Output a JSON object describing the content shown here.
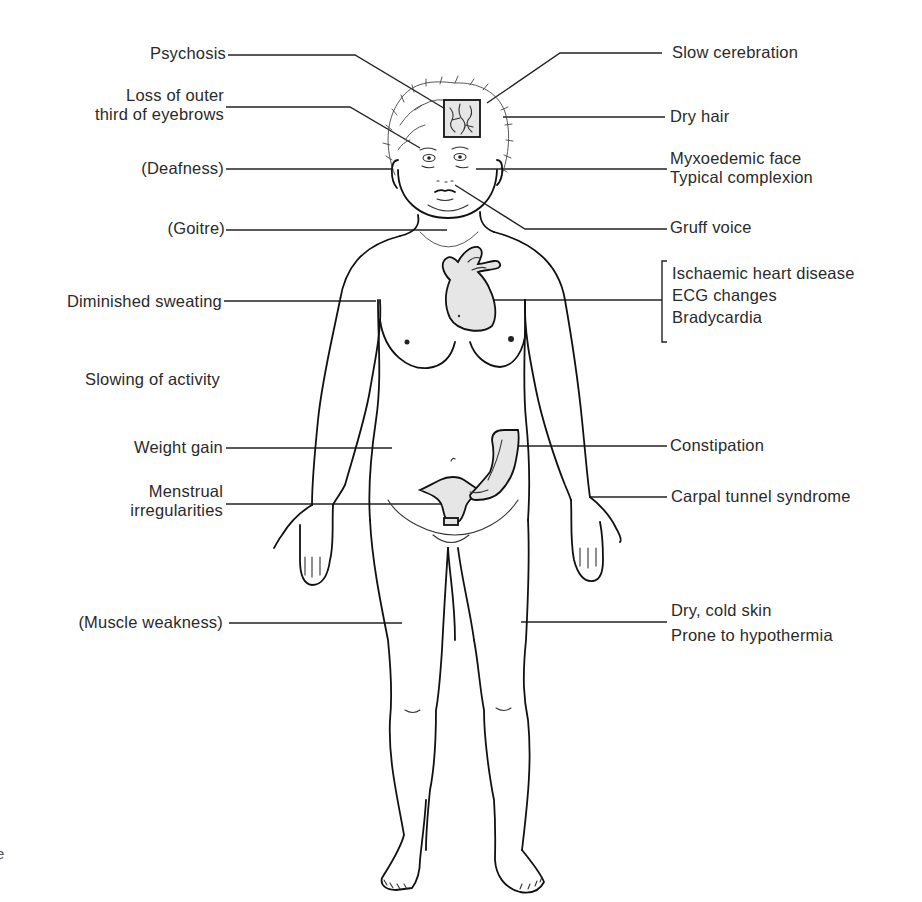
{
  "figure": {
    "organ_fill_color": "#e6e6e6",
    "line_color": "#222222",
    "background": "#ffffff"
  },
  "labels_left": [
    {
      "id": "psychosis",
      "lines": [
        "Psychosis"
      ]
    },
    {
      "id": "eyebrows",
      "lines": [
        "Loss of outer",
        "third of eyebrows"
      ]
    },
    {
      "id": "deafness",
      "lines": [
        "(Deafness)"
      ]
    },
    {
      "id": "goitre",
      "lines": [
        "(Goitre)"
      ]
    },
    {
      "id": "sweating",
      "lines": [
        "Diminished sweating"
      ]
    },
    {
      "id": "activity",
      "lines": [
        "Slowing of activity"
      ]
    },
    {
      "id": "weight",
      "lines": [
        "Weight gain"
      ]
    },
    {
      "id": "menstrual",
      "lines": [
        "Menstrual",
        "irregularities"
      ]
    },
    {
      "id": "muscle",
      "lines": [
        "(Muscle weakness)"
      ]
    }
  ],
  "labels_right": [
    {
      "id": "cerebration",
      "lines": [
        "Slow cerebration"
      ]
    },
    {
      "id": "hair",
      "lines": [
        "Dry hair"
      ]
    },
    {
      "id": "face",
      "lines": [
        "Myxoedemic face",
        "Typical complexion"
      ]
    },
    {
      "id": "voice",
      "lines": [
        "Gruff voice"
      ]
    },
    {
      "id": "heart",
      "lines": [
        "Ischaemic heart disease",
        "ECG changes",
        "Bradycardia"
      ]
    },
    {
      "id": "constipation",
      "lines": [
        "Constipation"
      ]
    },
    {
      "id": "carpal",
      "lines": [
        "Carpal tunnel syndrome"
      ]
    },
    {
      "id": "skin",
      "lines": [
        "Dry, cold skin",
        "Prone to hypothermia"
      ]
    }
  ],
  "stray_text": {
    "bottom_left_fragment": "e"
  }
}
